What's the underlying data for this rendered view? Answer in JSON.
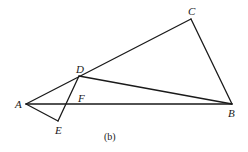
{
  "figure": {
    "caption": "(b)",
    "points": {
      "A": {
        "label": "A",
        "x": 26,
        "y": 104
      },
      "B": {
        "label": "B",
        "x": 232,
        "y": 104
      },
      "C": {
        "label": "C",
        "x": 191,
        "y": 19
      },
      "D": {
        "label": "D",
        "x": 79,
        "y": 76
      },
      "E": {
        "label": "E",
        "x": 58,
        "y": 121
      },
      "F": {
        "label": "F",
        "x": 66,
        "y": 104
      }
    },
    "segments": [
      [
        "A",
        "C"
      ],
      [
        "C",
        "B"
      ],
      [
        "D",
        "B"
      ],
      [
        "A",
        "B"
      ],
      [
        "A",
        "E"
      ],
      [
        "E",
        "D"
      ]
    ],
    "label_positions": {
      "A": {
        "x": 15,
        "y": 108
      },
      "B": {
        "x": 228,
        "y": 117
      },
      "C": {
        "x": 188,
        "y": 15
      },
      "D": {
        "x": 76,
        "y": 73
      },
      "E": {
        "x": 55,
        "y": 134
      },
      "F": {
        "x": 78,
        "y": 102
      }
    }
  }
}
